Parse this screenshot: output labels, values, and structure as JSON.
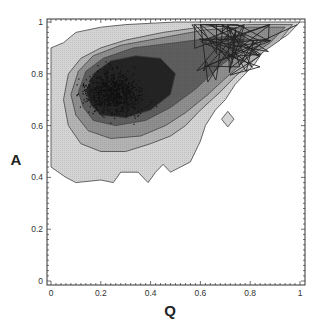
{
  "chart_data": {
    "type": "heatmap",
    "subtype": "filled contour density plot with scatter points and trajectory line overlay",
    "title": "",
    "xlabel": "Q",
    "ylabel": "A",
    "xlim": [
      0,
      1
    ],
    "ylim": [
      0,
      1
    ],
    "xticks": [
      "0",
      "0.2",
      "0.4",
      "0.6",
      "0.8",
      "1"
    ],
    "yticks": [
      "0",
      "0.2",
      "0.4",
      "0.6",
      "0.8",
      "1"
    ],
    "grid": false,
    "legend": null,
    "contour_levels": [
      {
        "level": 1,
        "fill": "#d4d4d4",
        "outline": [
          [
            0.0,
            0.9
          ],
          [
            0.05,
            0.92
          ],
          [
            0.1,
            0.96
          ],
          [
            0.2,
            0.98
          ],
          [
            0.3,
            0.99
          ],
          [
            0.5,
            1.0
          ],
          [
            0.7,
            1.0
          ],
          [
            0.85,
            1.0
          ],
          [
            0.95,
            1.0
          ],
          [
            1.0,
            1.0
          ],
          [
            0.98,
            0.98
          ],
          [
            0.95,
            0.95
          ],
          [
            0.9,
            0.92
          ],
          [
            0.86,
            0.9
          ],
          [
            0.82,
            0.84
          ],
          [
            0.78,
            0.8
          ],
          [
            0.74,
            0.76
          ],
          [
            0.7,
            0.7
          ],
          [
            0.66,
            0.66
          ],
          [
            0.62,
            0.6
          ],
          [
            0.6,
            0.54
          ],
          [
            0.56,
            0.46
          ],
          [
            0.52,
            0.44
          ],
          [
            0.48,
            0.42
          ],
          [
            0.45,
            0.45
          ],
          [
            0.42,
            0.42
          ],
          [
            0.39,
            0.38
          ],
          [
            0.35,
            0.42
          ],
          [
            0.28,
            0.42
          ],
          [
            0.25,
            0.38
          ],
          [
            0.2,
            0.39
          ],
          [
            0.1,
            0.38
          ],
          [
            0.06,
            0.4
          ],
          [
            0.0,
            0.44
          ]
        ]
      },
      {
        "level": 2,
        "fill": "#b4b4b4",
        "outline": [
          [
            0.05,
            0.7
          ],
          [
            0.07,
            0.8
          ],
          [
            0.12,
            0.86
          ],
          [
            0.2,
            0.9
          ],
          [
            0.3,
            0.93
          ],
          [
            0.45,
            0.96
          ],
          [
            0.6,
            0.98
          ],
          [
            0.8,
            0.99
          ],
          [
            0.97,
            0.99
          ],
          [
            0.92,
            0.93
          ],
          [
            0.86,
            0.89
          ],
          [
            0.8,
            0.84
          ],
          [
            0.74,
            0.79
          ],
          [
            0.68,
            0.73
          ],
          [
            0.6,
            0.66
          ],
          [
            0.54,
            0.6
          ],
          [
            0.48,
            0.56
          ],
          [
            0.4,
            0.53
          ],
          [
            0.3,
            0.5
          ],
          [
            0.2,
            0.5
          ],
          [
            0.12,
            0.53
          ],
          [
            0.07,
            0.6
          ]
        ]
      },
      {
        "level": 3,
        "fill": "#8e8e8e",
        "outline": [
          [
            0.08,
            0.72
          ],
          [
            0.11,
            0.81
          ],
          [
            0.17,
            0.87
          ],
          [
            0.28,
            0.91
          ],
          [
            0.45,
            0.94
          ],
          [
            0.62,
            0.97
          ],
          [
            0.8,
            0.98
          ],
          [
            0.94,
            0.98
          ],
          [
            0.88,
            0.92
          ],
          [
            0.8,
            0.87
          ],
          [
            0.72,
            0.8
          ],
          [
            0.63,
            0.72
          ],
          [
            0.54,
            0.65
          ],
          [
            0.46,
            0.6
          ],
          [
            0.36,
            0.56
          ],
          [
            0.24,
            0.55
          ],
          [
            0.15,
            0.58
          ],
          [
            0.1,
            0.64
          ]
        ]
      },
      {
        "level": 4,
        "fill": "#5e5e5e",
        "outline": [
          [
            0.11,
            0.73
          ],
          [
            0.14,
            0.81
          ],
          [
            0.21,
            0.86
          ],
          [
            0.33,
            0.9
          ],
          [
            0.5,
            0.92
          ],
          [
            0.66,
            0.94
          ],
          [
            0.78,
            0.95
          ],
          [
            0.76,
            0.89
          ],
          [
            0.68,
            0.83
          ],
          [
            0.58,
            0.74
          ],
          [
            0.48,
            0.67
          ],
          [
            0.38,
            0.62
          ],
          [
            0.26,
            0.6
          ],
          [
            0.17,
            0.62
          ],
          [
            0.13,
            0.67
          ]
        ]
      },
      {
        "level": 5,
        "fill": "#242424",
        "outline": [
          [
            0.14,
            0.73
          ],
          [
            0.17,
            0.8
          ],
          [
            0.24,
            0.85
          ],
          [
            0.34,
            0.87
          ],
          [
            0.44,
            0.86
          ],
          [
            0.5,
            0.8
          ],
          [
            0.48,
            0.72
          ],
          [
            0.4,
            0.66
          ],
          [
            0.3,
            0.63
          ],
          [
            0.2,
            0.64
          ],
          [
            0.16,
            0.68
          ]
        ]
      }
    ],
    "scatter_cloud": {
      "center": [
        0.25,
        0.73
      ],
      "spread_x": 0.14,
      "spread_y": 0.1,
      "approx_points": 900
    },
    "trajectory_region": {
      "q_range": [
        0.55,
        1.0
      ],
      "a_range": [
        0.7,
        1.0
      ],
      "endpoint": [
        0.99,
        0.99
      ]
    }
  }
}
